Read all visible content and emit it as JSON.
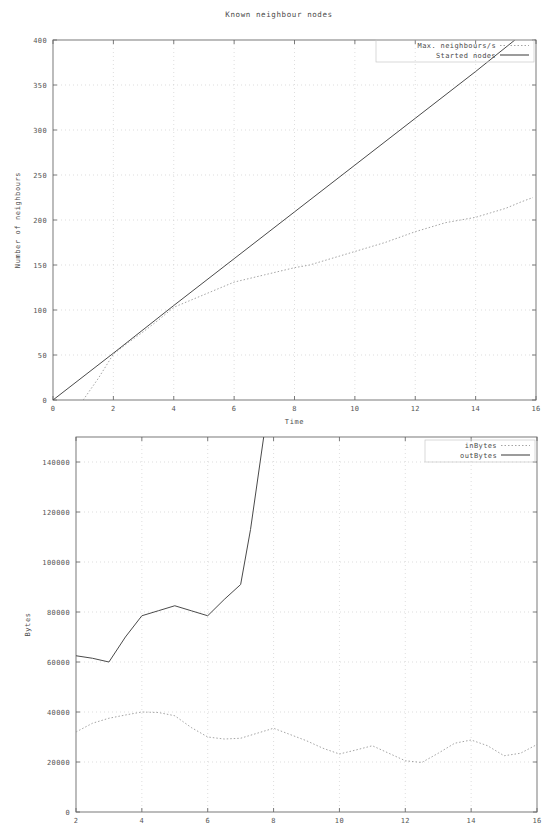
{
  "figures": {
    "top": {
      "title": "Known neighbour nodes",
      "xlabel": "Time",
      "ylabel": "Number of neighbours",
      "legend": {
        "series1": "Max. neighbours/s",
        "series2": "Started nodes"
      },
      "xticks": [
        "0",
        "2",
        "4",
        "6",
        "8",
        "10",
        "12",
        "14",
        "16"
      ],
      "yticks": [
        "0",
        "50",
        "100",
        "150",
        "200",
        "250",
        "300",
        "350",
        "400"
      ]
    },
    "bottom": {
      "title": "",
      "xlabel": "",
      "ylabel": "Bytes",
      "legend": {
        "series1": "inBytes",
        "series2": "outBytes"
      },
      "xticks": [
        "2",
        "4",
        "6",
        "8",
        "10",
        "12",
        "14",
        "16"
      ],
      "yticks": [
        "0",
        "20000",
        "40000",
        "60000",
        "80000",
        "100000",
        "120000",
        "140000"
      ]
    }
  },
  "colors": {
    "axis": "#6b6b6b",
    "grid": "#c8c8c8",
    "series_solid": "#4a4a4a",
    "series_dotted": "#9a9a9a",
    "background": "#ffffff",
    "text": "#4a4a4a"
  },
  "chart_data": [
    {
      "type": "line",
      "title": "Known neighbour nodes",
      "xlabel": "Time",
      "ylabel": "Number of neighbours",
      "xlim": [
        0,
        16
      ],
      "ylim": [
        0,
        400
      ],
      "xticks": [
        0,
        2,
        4,
        6,
        8,
        10,
        12,
        14,
        16
      ],
      "yticks": [
        0,
        50,
        100,
        150,
        200,
        250,
        300,
        350,
        400
      ],
      "grid": true,
      "legend_position": "top-right",
      "series": [
        {
          "name": "Max. neighbours/s",
          "style": "dotted",
          "x": [
            1.0,
            1.5,
            2.0,
            2.5,
            3.0,
            3.5,
            4.0,
            4.5,
            5.0,
            5.5,
            6.0,
            6.5,
            7.0,
            7.5,
            8.0,
            8.5,
            9.0,
            9.5,
            10.0,
            10.5,
            11.0,
            11.5,
            12.0,
            12.5,
            13.0,
            13.5,
            14.0,
            14.5,
            15.0,
            15.5,
            15.9
          ],
          "y": [
            0,
            24,
            51,
            64,
            76,
            89,
            103,
            110,
            117,
            124,
            131,
            135,
            139,
            143,
            147,
            150,
            155,
            160,
            165,
            170,
            175,
            181,
            187,
            192,
            197,
            200,
            203,
            208,
            213,
            220,
            225
          ]
        },
        {
          "name": "Started nodes",
          "style": "solid",
          "x": [
            0,
            2,
            4,
            6,
            8,
            10,
            12,
            14,
            15.3
          ],
          "y": [
            0,
            52,
            105,
            157,
            209,
            261,
            313,
            365,
            400
          ]
        }
      ]
    },
    {
      "type": "line",
      "title": "",
      "xlabel": "",
      "ylabel": "Bytes",
      "xlim": [
        2,
        16
      ],
      "ylim": [
        0,
        150000
      ],
      "xticks": [
        2,
        4,
        6,
        8,
        10,
        12,
        14,
        16
      ],
      "yticks": [
        0,
        20000,
        40000,
        60000,
        80000,
        100000,
        120000,
        140000
      ],
      "grid": true,
      "legend_position": "top-right",
      "series": [
        {
          "name": "inBytes",
          "style": "dotted",
          "x": [
            2.0,
            2.5,
            3.0,
            3.5,
            4.0,
            4.5,
            5.0,
            5.5,
            6.0,
            6.5,
            7.0,
            7.5,
            8.0,
            8.5,
            9.0,
            9.5,
            10.0,
            10.5,
            11.0,
            11.5,
            12.0,
            12.5,
            13.0,
            13.5,
            14.0,
            14.5,
            15.0,
            15.5,
            16.0
          ],
          "y": [
            32000,
            35500,
            37500,
            38800,
            40000,
            39800,
            38500,
            33800,
            30000,
            29200,
            29500,
            31500,
            33500,
            31000,
            28500,
            25500,
            23200,
            24800,
            26500,
            23500,
            20500,
            19800,
            23500,
            27500,
            28800,
            26500,
            22500,
            23500,
            27000
          ]
        },
        {
          "name": "outBytes",
          "style": "solid",
          "x": [
            2.0,
            2.5,
            3.0,
            3.5,
            4.0,
            4.5,
            5.0,
            5.5,
            6.0,
            6.5,
            7.0,
            7.3,
            7.7
          ],
          "y": [
            62500,
            61500,
            60000,
            70000,
            78500,
            80500,
            82500,
            80500,
            78500,
            85000,
            91000,
            113000,
            150000
          ]
        }
      ]
    }
  ]
}
